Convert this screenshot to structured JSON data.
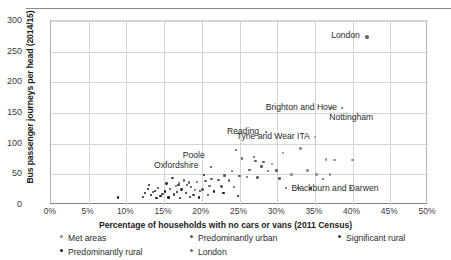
{
  "chart_data": {
    "type": "scatter",
    "title": "",
    "xlabel": "Percentage of households with no cars or vans (2011 Census)",
    "ylabel": "Bus passenger journeys per head (2014/15)",
    "xlim": [
      0,
      50
    ],
    "ylim": [
      0,
      300
    ],
    "xticks": [
      "0%",
      "5%",
      "10%",
      "15%",
      "20%",
      "25%",
      "30%",
      "35%",
      "40%",
      "45%",
      "50%"
    ],
    "xtick_values": [
      0,
      5,
      10,
      15,
      20,
      25,
      30,
      35,
      40,
      45,
      50
    ],
    "yticks": [
      "0",
      "50",
      "100",
      "150",
      "200",
      "250",
      "300"
    ],
    "ytick_values": [
      0,
      50,
      100,
      150,
      200,
      250,
      300
    ],
    "grid": "both",
    "legend_position": "below",
    "colors": {
      "met_areas": "#8d8d8d",
      "predominantly_urban": "#5d5d5d",
      "significant_rural": "#3c3c3c",
      "predominantly_rural": "#1a1a1a",
      "london": "#6b6b6b"
    },
    "series": [
      {
        "name": "London",
        "key": "london",
        "points": [
          {
            "x": 41.9,
            "y": 274,
            "label": "London"
          }
        ]
      },
      {
        "name": "Met areas",
        "key": "met",
        "points": [
          {
            "x": 37.2,
            "y": 158,
            "label": "Nottingham"
          },
          {
            "x": 35.0,
            "y": 111,
            "label": "Tyne and Wear ITA"
          },
          {
            "x": 33.1,
            "y": 92
          },
          {
            "x": 30.8,
            "y": 85
          },
          {
            "x": 36.5,
            "y": 74
          },
          {
            "x": 37.6,
            "y": 73
          },
          {
            "x": 40.0,
            "y": 73
          },
          {
            "x": 29.3,
            "y": 67
          },
          {
            "x": 34.0,
            "y": 56
          },
          {
            "x": 31.9,
            "y": 50
          },
          {
            "x": 35.2,
            "y": 50
          },
          {
            "x": 37.0,
            "y": 50
          }
        ]
      },
      {
        "name": "Predominantly urban",
        "key": "purban",
        "points": [
          {
            "x": 38.6,
            "y": 158,
            "label": "Brighton and Hove"
          },
          {
            "x": 28.5,
            "y": 119,
            "label": "Reading"
          },
          {
            "x": 24.5,
            "y": 90
          },
          {
            "x": 25.3,
            "y": 76
          },
          {
            "x": 26.9,
            "y": 78
          },
          {
            "x": 27.1,
            "y": 72
          },
          {
            "x": 28.2,
            "y": 70
          },
          {
            "x": 27.9,
            "y": 63
          },
          {
            "x": 26.3,
            "y": 57
          },
          {
            "x": 24.0,
            "y": 55
          },
          {
            "x": 28.8,
            "y": 55
          },
          {
            "x": 29.9,
            "y": 56
          },
          {
            "x": 23.0,
            "y": 48
          },
          {
            "x": 25.0,
            "y": 47
          },
          {
            "x": 26.0,
            "y": 46
          },
          {
            "x": 27.4,
            "y": 45
          },
          {
            "x": 30.3,
            "y": 43
          },
          {
            "x": 21.3,
            "y": 42
          },
          {
            "x": 22.2,
            "y": 41
          },
          {
            "x": 23.6,
            "y": 40
          },
          {
            "x": 20.5,
            "y": 39
          },
          {
            "x": 19.4,
            "y": 38
          },
          {
            "x": 18.3,
            "y": 37
          },
          {
            "x": 17.6,
            "y": 40
          },
          {
            "x": 17.0,
            "y": 36
          },
          {
            "x": 16.6,
            "y": 31
          },
          {
            "x": 21.0,
            "y": 31
          },
          {
            "x": 22.6,
            "y": 30
          },
          {
            "x": 24.3,
            "y": 29
          },
          {
            "x": 31.2,
            "y": 28,
            "label": "Blackburn and Darwen"
          },
          {
            "x": 32.8,
            "y": 28
          },
          {
            "x": 34.4,
            "y": 27
          },
          {
            "x": 36.1,
            "y": 42
          },
          {
            "x": 39.8,
            "y": 28
          },
          {
            "x": 20.1,
            "y": 25
          },
          {
            "x": 19.1,
            "y": 24
          }
        ]
      },
      {
        "name": "Significant rural",
        "key": "sigrural",
        "points": [
          {
            "x": 21.2,
            "y": 62,
            "label": "Poole"
          },
          {
            "x": 16.1,
            "y": 44
          },
          {
            "x": 15.3,
            "y": 35
          },
          {
            "x": 16.9,
            "y": 33
          },
          {
            "x": 18.0,
            "y": 33
          },
          {
            "x": 18.6,
            "y": 29
          },
          {
            "x": 14.2,
            "y": 28
          },
          {
            "x": 15.8,
            "y": 26
          },
          {
            "x": 17.3,
            "y": 25
          },
          {
            "x": 19.8,
            "y": 23
          },
          {
            "x": 13.5,
            "y": 21
          },
          {
            "x": 14.8,
            "y": 18
          },
          {
            "x": 16.3,
            "y": 17
          },
          {
            "x": 18.9,
            "y": 16
          },
          {
            "x": 20.8,
            "y": 16
          }
        ]
      },
      {
        "name": "Predominantly rural",
        "key": "predrural",
        "points": [
          {
            "x": 20.3,
            "y": 49,
            "label": "Oxfordshire"
          },
          {
            "x": 13.0,
            "y": 33
          },
          {
            "x": 12.9,
            "y": 26
          },
          {
            "x": 13.8,
            "y": 23
          },
          {
            "x": 12.5,
            "y": 20
          },
          {
            "x": 13.3,
            "y": 16
          },
          {
            "x": 14.5,
            "y": 15
          },
          {
            "x": 15.1,
            "y": 22
          },
          {
            "x": 16.7,
            "y": 21
          },
          {
            "x": 17.9,
            "y": 20
          },
          {
            "x": 8.9,
            "y": 12
          },
          {
            "x": 12.2,
            "y": 13
          },
          {
            "x": 14.0,
            "y": 11
          },
          {
            "x": 15.6,
            "y": 12
          },
          {
            "x": 17.1,
            "y": 11
          },
          {
            "x": 18.4,
            "y": 13
          },
          {
            "x": 19.6,
            "y": 12
          },
          {
            "x": 21.6,
            "y": 22
          },
          {
            "x": 22.9,
            "y": 20
          },
          {
            "x": 24.8,
            "y": 15
          }
        ]
      }
    ],
    "annotations": [
      {
        "text": "London",
        "x": 41.0,
        "y": 277,
        "anchor": "right"
      },
      {
        "text": "Nottingham",
        "x": 36.9,
        "y": 143,
        "anchor": "left"
      },
      {
        "text": "Brighton and Hove",
        "x": 37.9,
        "y": 160,
        "anchor": "right"
      },
      {
        "text": "Tyne and Wear ITA",
        "x": 34.3,
        "y": 113,
        "anchor": "right"
      },
      {
        "text": "Reading",
        "x": 27.6,
        "y": 120,
        "anchor": "right"
      },
      {
        "text": "Poole",
        "x": 20.4,
        "y": 81,
        "anchor": "right"
      },
      {
        "text": "Oxfordshire",
        "x": 19.5,
        "y": 66,
        "anchor": "right"
      },
      {
        "text": "Blackburn and Darwen",
        "x": 31.9,
        "y": 27,
        "anchor": "left"
      }
    ]
  },
  "axes": {
    "ylabel": "Bus passenger journeys per head (2014/15)",
    "xlabel": "Percentage of households with no cars or vans (2011 Census)"
  },
  "legend": {
    "items": [
      {
        "label": "Met areas",
        "key": "met",
        "row": 0,
        "col": 0
      },
      {
        "label": "Predominantly urban",
        "key": "purban",
        "row": 0,
        "col": 1
      },
      {
        "label": "Significant rural",
        "key": "sigrural",
        "row": 0,
        "col": 2
      },
      {
        "label": "Predominantly rural",
        "key": "predrural",
        "row": 1,
        "col": 0
      },
      {
        "label": "London",
        "key": "london",
        "row": 1,
        "col": 1
      }
    ]
  }
}
